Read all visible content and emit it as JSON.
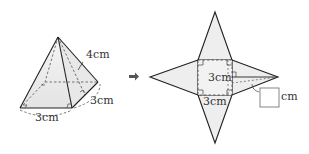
{
  "figure": {
    "pyramid": {
      "slant_height_label": "4cm",
      "side_label_right": "3cm",
      "side_label_bottom": "3cm"
    },
    "arrow": "right-arrow",
    "net": {
      "square_side_label_left": "3cm",
      "square_side_label_bottom": "3cm",
      "answer_box_unit": "cm",
      "answer_box_value": ""
    }
  },
  "colors": {
    "line": "#222222",
    "face_fill": "#eeeeee",
    "dashed": "#555555"
  }
}
